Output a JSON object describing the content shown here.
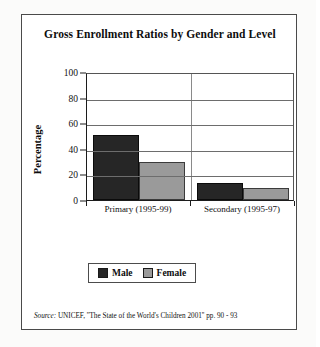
{
  "figure": {
    "title": "Gross Enrollment Ratios by Gender and Level",
    "source_prefix": "Source:",
    "source_text": "UNICEF, ''The State of the World's Children 2001'' pp. 90 - 93"
  },
  "legend": {
    "items": [
      {
        "label": "Male",
        "color": "#262626"
      },
      {
        "label": "Female",
        "color": "#9a9a9a"
      }
    ]
  },
  "chart_data": {
    "type": "bar",
    "title": "Gross Enrollment Ratios by Gender and Level",
    "xlabel": "",
    "ylabel": "Percentage",
    "categories": [
      "Primary (1995-99)",
      "Secondary (1995-97)"
    ],
    "series": [
      {
        "name": "Male",
        "values": [
          51,
          13
        ],
        "color": "#262626"
      },
      {
        "name": "Female",
        "values": [
          30,
          9
        ],
        "color": "#9a9a9a"
      }
    ],
    "ylim": [
      0,
      100
    ],
    "yticks": [
      0,
      20,
      40,
      60,
      80,
      100
    ],
    "ytick_labels": [
      "0",
      "20",
      "40",
      "60",
      "80",
      "100"
    ],
    "grid": true,
    "grid_axis": "y",
    "legend_position": "bottom"
  }
}
